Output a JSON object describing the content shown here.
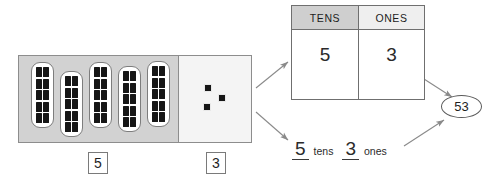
{
  "diagram": {
    "line_color": "#7a7a7a",
    "tens_panel_color": "#d2d2d2",
    "ones_panel_color": "#f4f4f4",
    "header_tens_color": "#cfcfcf",
    "header_ones_color": "#efefef"
  },
  "blocks": {
    "tens": {
      "rod_count": 5,
      "pips_per_rod": 10,
      "count_label": "5"
    },
    "ones": {
      "cube_count": 3,
      "count_label": "3"
    }
  },
  "place_value_table": {
    "headers": [
      "TENS",
      "ONES"
    ],
    "values": [
      "5",
      "3"
    ]
  },
  "word_form": {
    "tens_value": "5",
    "tens_word": "tens",
    "ones_value": "3",
    "ones_word": "ones"
  },
  "result": {
    "value": "53"
  },
  "arrows": [
    {
      "name": "blocks-to-table",
      "from": "blocks-panel",
      "to": "pv-table"
    },
    {
      "name": "blocks-to-word-form",
      "from": "blocks-panel",
      "to": "word-form"
    },
    {
      "name": "table-to-result",
      "from": "pv-table",
      "to": "result-oval"
    },
    {
      "name": "word-form-to-result",
      "from": "word-form",
      "to": "result-oval"
    }
  ]
}
